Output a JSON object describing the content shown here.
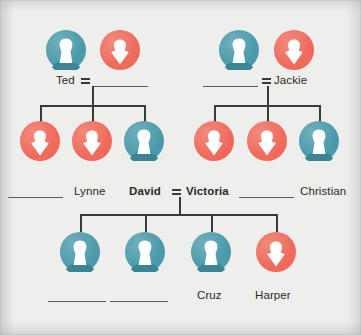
{
  "diagram": {
    "colors": {
      "male": "#4a9aab",
      "female": "#ef6a5a",
      "background": "#eeeeec",
      "line": "#3a3a3a",
      "text": "#2b2b2b"
    },
    "generations": [
      {
        "id": "generation-1",
        "couples": [
          {
            "id": "couple-ted",
            "partners": [
              {
                "id": "ted",
                "label": "Ted",
                "sex": "male",
                "filled": true,
                "bold": false
              },
              {
                "id": "ted-spouse",
                "label": "",
                "sex": "female",
                "filled": false,
                "bold": false
              }
            ],
            "marriage_symbol": "="
          },
          {
            "id": "couple-jackie",
            "partners": [
              {
                "id": "jackie-spouse",
                "label": "",
                "sex": "male",
                "filled": false,
                "bold": false
              },
              {
                "id": "jackie",
                "label": "Jackie",
                "sex": "female",
                "filled": true,
                "bold": false
              }
            ],
            "marriage_symbol": "="
          }
        ]
      },
      {
        "id": "generation-2",
        "children_left": [
          {
            "id": "child-l1",
            "label": "",
            "sex": "female",
            "filled": false,
            "bold": false
          },
          {
            "id": "lynne",
            "label": "Lynne",
            "sex": "female",
            "filled": true,
            "bold": false
          },
          {
            "id": "david",
            "label": "David",
            "sex": "male",
            "filled": true,
            "bold": true
          }
        ],
        "children_right": [
          {
            "id": "victoria",
            "label": "Victoria",
            "sex": "female",
            "filled": true,
            "bold": true
          },
          {
            "id": "child-r2",
            "label": "",
            "sex": "female",
            "filled": false,
            "bold": false
          },
          {
            "id": "christian",
            "label": "Christian",
            "sex": "male",
            "filled": true,
            "bold": false
          }
        ],
        "marriage_symbol": "="
      },
      {
        "id": "generation-3",
        "children": [
          {
            "id": "child-b1",
            "label": "",
            "sex": "male",
            "filled": false,
            "bold": false
          },
          {
            "id": "child-b2",
            "label": "",
            "sex": "male",
            "filled": false,
            "bold": false
          },
          {
            "id": "cruz",
            "label": "Cruz",
            "sex": "male",
            "filled": true,
            "bold": false
          },
          {
            "id": "harper",
            "label": "Harper",
            "sex": "female",
            "filled": true,
            "bold": false
          }
        ]
      }
    ]
  }
}
